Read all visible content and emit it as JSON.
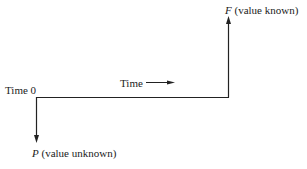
{
  "diagram": {
    "type": "time-line",
    "labels": {
      "time_zero": "Time 0",
      "time_axis": "Time",
      "future_symbol": "F",
      "future_note": "(value known)",
      "present_symbol": "P",
      "present_note": "(value unknown)"
    },
    "colors": {
      "line": "#222222",
      "background": "#ffffff"
    }
  }
}
